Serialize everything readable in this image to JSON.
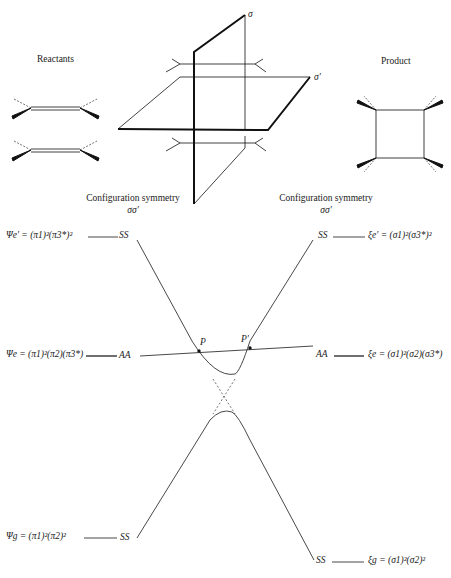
{
  "header": {
    "reactants_label": "Reactants",
    "product_label": "Product",
    "plane_sigma": "σ",
    "plane_sigma_prime": "σ′"
  },
  "symmetry_headers": {
    "left": {
      "title": "Configuration symmetry",
      "ops": "σσ′"
    },
    "right": {
      "title": "Configuration symmetry",
      "ops": "σσ′"
    }
  },
  "left_states": [
    {
      "name": "Psi_e_prime",
      "formula": "Ψe′ = (π1)²(π3*)²",
      "symmetry": "SS"
    },
    {
      "name": "Psi_e",
      "formula": "Ψe = (π1)²(π2)(π3*)",
      "symmetry": "AA"
    },
    {
      "name": "Psi_g",
      "formula": "Ψg = (π1)²(π2)²",
      "symmetry": "SS"
    }
  ],
  "right_states": [
    {
      "name": "xi_e_prime",
      "formula": "ξe′ = (σ1)²(σ3*)²",
      "symmetry": "SS"
    },
    {
      "name": "xi_e",
      "formula": "ξe = (σ1)²(σ2)(σ3*)",
      "symmetry": "AA"
    },
    {
      "name": "xi_g",
      "formula": "ξg = (σ1)²(σ2)²",
      "symmetry": "SS"
    }
  ],
  "crossing_points": {
    "p": "P",
    "p_prime": "P′"
  }
}
